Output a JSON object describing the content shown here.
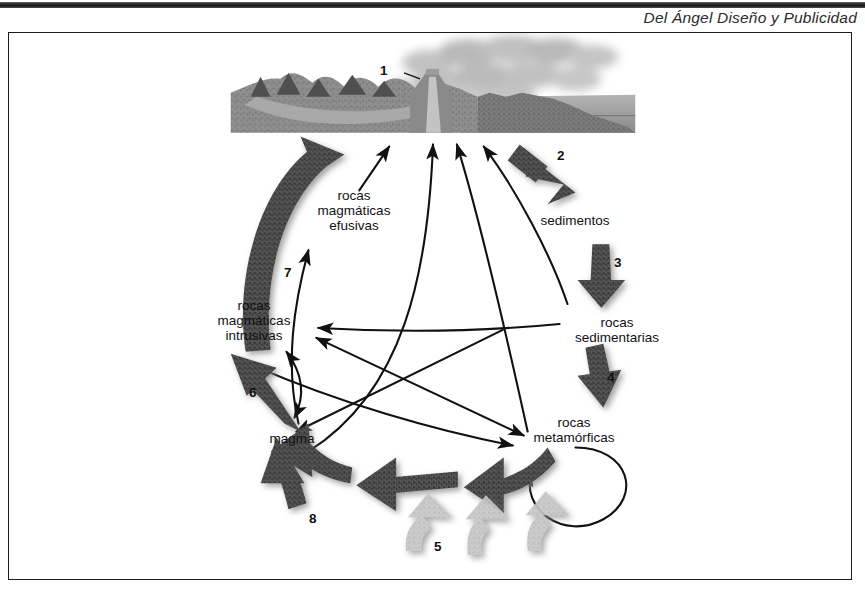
{
  "header": {
    "credit": "Del Ángel Diseño y Publicidad"
  },
  "diagram": {
    "nodes": [
      {
        "id": "rocas-magmaticas-efusivas",
        "label": "rocas\nmagmáticas\nefusivas"
      },
      {
        "id": "rocas-magmaticas-intrusivas",
        "label": "rocas\nmagmáticas\nintrusivas"
      },
      {
        "id": "magma",
        "label": "magma"
      },
      {
        "id": "sedimentos",
        "label": "sedimentos"
      },
      {
        "id": "rocas-sedimentarias",
        "label": "rocas\nsedimentarias"
      },
      {
        "id": "rocas-metamorficas",
        "label": "rocas\nmetamórficas"
      }
    ],
    "step_numbers": [
      {
        "id": "step-1",
        "label": "1"
      },
      {
        "id": "step-2",
        "label": "2"
      },
      {
        "id": "step-3",
        "label": "3"
      },
      {
        "id": "step-4",
        "label": "4"
      },
      {
        "id": "step-5",
        "label": "5"
      },
      {
        "id": "step-6",
        "label": "6"
      },
      {
        "id": "step-7",
        "label": "7"
      },
      {
        "id": "step-8",
        "label": "8"
      }
    ],
    "colors": {
      "ink": "#111111",
      "thick_arrow_dark": "#4a4a4a",
      "thick_arrow_light": "#b9b9b9",
      "terrain": "#8d8d8d",
      "water": "#9a9a9a",
      "smoke": "#a5a5a5",
      "frame": "#1a1a1a"
    }
  }
}
